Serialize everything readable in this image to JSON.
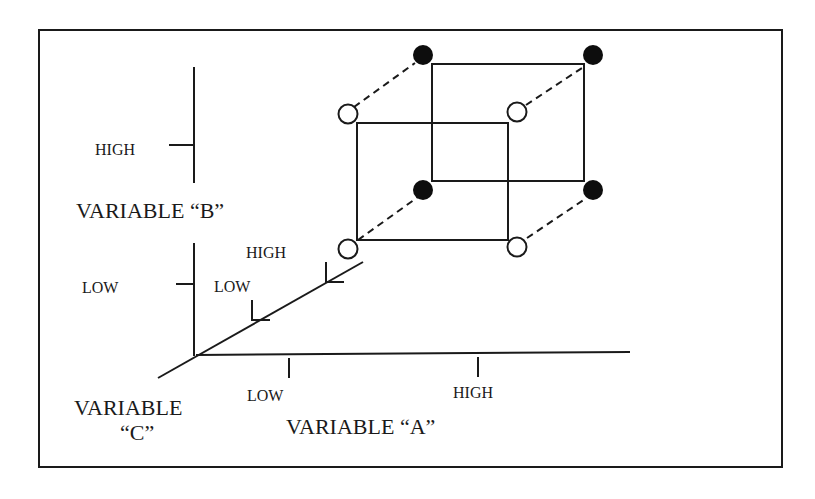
{
  "diagram": {
    "axis_b": {
      "name": "VARIABLE “B”",
      "high": "HIGH",
      "low": "LOW"
    },
    "axis_a": {
      "name": "VARIABLE “A”",
      "low": "LOW",
      "high": "HIGH"
    },
    "axis_c": {
      "name_line1": "VARIABLE",
      "name_line2": "“C”",
      "low": "LOW",
      "high": "HIGH"
    },
    "legend_markers": {
      "open_circle": "C low level (front face)",
      "filled_circle": "C high level (back face)"
    },
    "colors": {
      "line": "#1a1a1a",
      "filled_marker": "#0d0d0d",
      "open_marker_fill": "#ffffff",
      "background": "#ffffff"
    }
  }
}
